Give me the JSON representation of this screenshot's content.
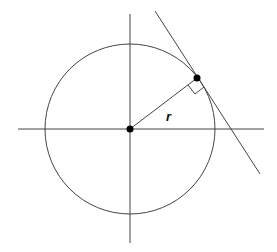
{
  "diagram": {
    "type": "circle-tangent",
    "radius_label": "r",
    "colors": {
      "stroke": "#444444",
      "point": "#000000",
      "background": "#ffffff"
    },
    "geometry": {
      "center": [
        130,
        129
      ],
      "radius": 85,
      "tangent_point": [
        197,
        78
      ],
      "x_axis": [
        [
          18,
          129
        ],
        [
          264,
          129
        ]
      ],
      "y_axis": [
        [
          130,
          14
        ],
        [
          130,
          243
        ]
      ],
      "tangent_line": [
        [
          155,
          11
        ],
        [
          260,
          174
        ]
      ],
      "right_angle_marker": [
        [
          188,
          84
        ],
        [
          194,
          93
        ],
        [
          203,
          87
        ]
      ]
    }
  }
}
